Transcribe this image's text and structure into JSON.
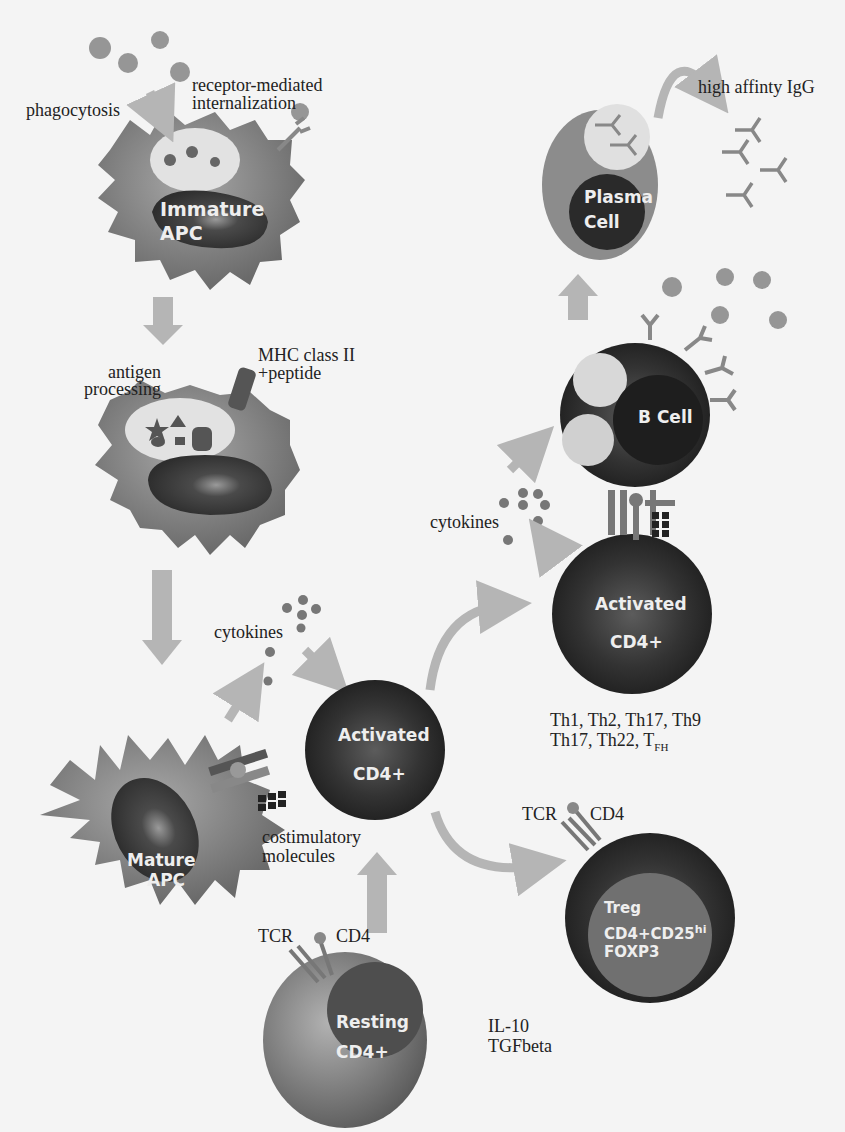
{
  "figure": {
    "type": "immune-response-diagram",
    "cells": {
      "immature_apc": {
        "line1": "Immature",
        "line2": "APC"
      },
      "processing_apc": {
        "label": ""
      },
      "mature_apc": {
        "line1": "Mature",
        "line2": "APC"
      },
      "activated_cd4_left": {
        "line1": "Activated",
        "line2": "CD4+"
      },
      "activated_cd4_right": {
        "line1": "Activated",
        "line2": "CD4+"
      },
      "resting_cd4": {
        "line1": "Resting",
        "line2": "CD4+"
      },
      "treg": {
        "line1": "Treg",
        "line2": "CD4+CD25",
        "line2_sup": "hi",
        "line3": "FOXP3"
      },
      "b_cell": {
        "label": "B Cell"
      },
      "plasma_cell": {
        "line1": "Plasma",
        "line2": "Cell"
      }
    },
    "labels": {
      "phagocytosis": "phagocytosis",
      "receptor_mediated_1": "receptor-mediated",
      "receptor_mediated_2": "internalization",
      "high_affinity_igg": "high affinty IgG",
      "antigen_processing_1": "antigen",
      "antigen_processing_2": "processing",
      "mhc_1": "MHC class II",
      "mhc_2": "+peptide",
      "cytokines_left": "cytokines",
      "cytokines_right": "cytokines",
      "costim_1": "costimulatory",
      "costim_2": "molecules",
      "th_subsets_1": "Th1, Th2, Th17, Th9",
      "th_subsets_2": "Th17, Th22, T",
      "th_subsets_2_sub": "FH",
      "tcr_treg": "TCR",
      "cd4_treg": "CD4",
      "tcr_resting": "TCR",
      "cd4_resting": "CD4",
      "treg_cytokine_1": "IL-10",
      "treg_cytokine_2": "TGFbeta"
    },
    "colors": {
      "background": "#f4f4f4",
      "cell_light": "#8a8a8a",
      "cell_mid": "#6e6e6e",
      "nucleus_dark": "#3a3a3a",
      "vesicle": "#e2e2e2",
      "arrow": "#b5b5b5",
      "text": "#222222"
    }
  }
}
